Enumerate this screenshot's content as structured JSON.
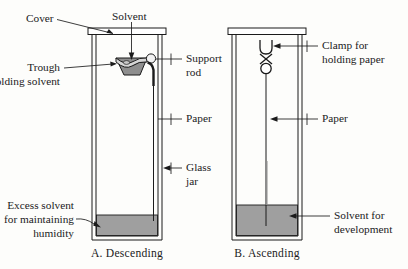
{
  "figure": {
    "background_color": "#fdfdfb",
    "ink_color": "#1b1b1b",
    "liquid_color": "#9f9f9f",
    "trough_color": "#8e8e8e"
  },
  "panels": [
    {
      "id": "A",
      "caption": "A. Descending",
      "labels": {
        "cover": "Cover",
        "solvent": "Solvent",
        "trough_line1": "Trough",
        "trough_line2": "holding solvent",
        "support_line1": "Support",
        "support_line2": "rod",
        "paper": "Paper",
        "glass_line1": "Glass",
        "glass_line2": "jar",
        "excess_line1": "Excess solvent",
        "excess_line2": "for maintaining",
        "excess_line3": "humidity"
      }
    },
    {
      "id": "B",
      "caption": "B. Ascending",
      "labels": {
        "clamp_line1": "Clamp for",
        "clamp_line2": "holding paper",
        "paper": "Paper",
        "solvent_line1": "Solvent for",
        "solvent_line2": "development"
      }
    }
  ]
}
